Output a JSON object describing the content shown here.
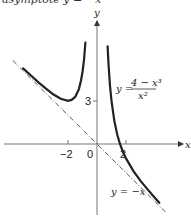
{
  "caption": "asymptote y = −x",
  "chart_data": {
    "type": "line",
    "title": "",
    "xlabel": "x",
    "ylabel": "y",
    "x_ticks": [
      {
        "value": -2,
        "label": "−2"
      },
      {
        "value": 0,
        "label": "0"
      },
      {
        "value": 2,
        "label": "2"
      }
    ],
    "y_ticks": [
      {
        "value": 3,
        "label": "3"
      }
    ],
    "xlim": [
      -6.4,
      6.2
    ],
    "ylim": [
      -5.0,
      8.6
    ],
    "grid": false,
    "legend": "none",
    "annotations": [
      {
        "text": "y = (4 − x³)/x²",
        "numerator": "4 − x³",
        "denominator": "x²",
        "lhs": "y =",
        "position": [
          2.6,
          3.9
        ]
      },
      {
        "text": "y = −x",
        "position": [
          1.0,
          -3.4
        ]
      }
    ],
    "series": [
      {
        "name": "y = (4 − x³)/x²",
        "style": "solid",
        "color": "#222222",
        "branches": [
          {
            "x": [
              -5.1,
              -4.5,
              -4.0,
              -3.5,
              -3.0,
              -2.5,
              -2.0,
              -1.75,
              -1.5,
              -1.25,
              -1.1,
              -1.0,
              -0.9,
              -0.8
            ],
            "y": [
              5.25,
              4.7,
              4.25,
              3.83,
              3.44,
              3.14,
              3.0,
              3.06,
              3.28,
              3.81,
              4.41,
              5.0,
              5.84,
              7.05
            ]
          },
          {
            "x": [
              0.73,
              0.8,
              0.9,
              1.0,
              1.2,
              1.4,
              1.587,
              1.8,
              2.0,
              2.5,
              3.0,
              3.5,
              4.0,
              4.3
            ],
            "y": [
              6.78,
              5.45,
              4.04,
              3.0,
              1.58,
              0.64,
              0.0,
              -0.57,
              -1.0,
              -1.86,
              -2.56,
              -3.17,
              -3.75,
              -4.08
            ]
          }
        ]
      },
      {
        "name": "y = −x",
        "style": "dashed",
        "color": "#555555",
        "x": [
          -5.8,
          4.8
        ],
        "y": [
          5.8,
          -4.8
        ]
      }
    ]
  },
  "labels": {
    "y_axis": "y",
    "x_axis": "x",
    "tick_neg2": "−2",
    "tick_0": "0",
    "tick_2": "2",
    "tick_3": "3",
    "eq_lhs": "y =",
    "eq_num": "4 − x³",
    "eq_den": "x²",
    "asym_label": "y = −x"
  }
}
